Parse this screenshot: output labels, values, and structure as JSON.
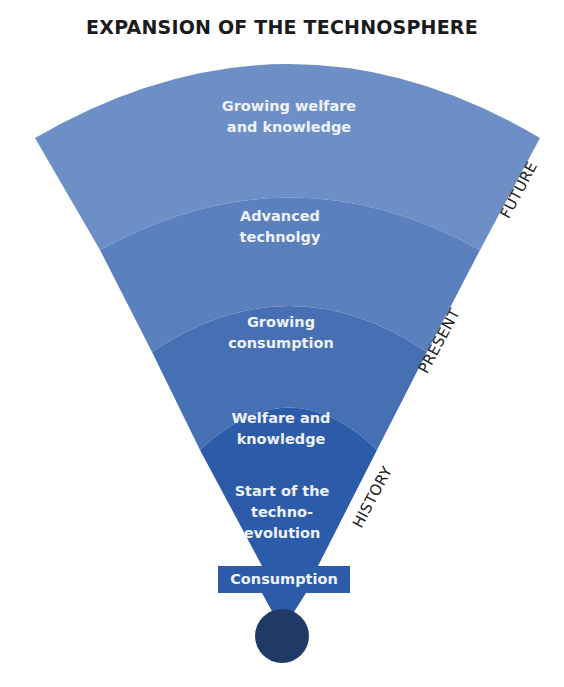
{
  "title": "EXPANSION OF THE TECHNOSPHERE",
  "bands": [
    {
      "label_line1": "Growing welfare",
      "label_line2": "and knowledge",
      "label_line3": "",
      "color": "#6d8fc6"
    },
    {
      "label_line1": "Advanced",
      "label_line2": "technolgy",
      "label_line3": "",
      "color": "#5b80bd"
    },
    {
      "label_line1": "Growing",
      "label_line2": "consumption",
      "label_line3": "",
      "color": "#4670b3"
    },
    {
      "label_line1": "Welfare and",
      "label_line2": "knowledge",
      "label_line3": "",
      "color": "#2c5ca9"
    },
    {
      "label_line1": "Start of the",
      "label_line2": "techno-",
      "label_line3": "evolution",
      "color": "#2c5ca9"
    }
  ],
  "base": {
    "label": "Consumption",
    "bar_color": "#2c5ca9",
    "circle_color": "#1f3a66"
  },
  "axis_labels": {
    "future": "FUTURE",
    "present": "PRESENT",
    "history": "HISTORY"
  }
}
